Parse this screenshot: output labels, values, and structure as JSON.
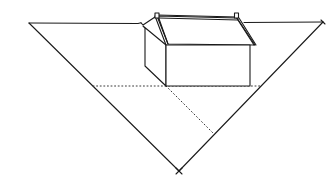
{
  "diagram": {
    "title": "",
    "colors": {
      "background": "#ffffff",
      "ink": "#1a1a1a",
      "construction": "#3a3a3a"
    },
    "elements": {
      "horizon_line": {
        "from": [
          29,
          23
        ],
        "to": [
          323,
          22
        ]
      },
      "left_ray": {
        "from": [
          29,
          23
        ],
        "to": [
          179,
          171
        ]
      },
      "right_ray": {
        "from": [
          323,
          22
        ],
        "to": [
          179,
          171
        ]
      },
      "bottom_vertex_mark": {
        "at": [
          179,
          171
        ],
        "glyph": "×"
      },
      "house_front_face": {
        "x1": 166,
        "y1": 45,
        "x2": 250,
        "y2": 86
      },
      "house_side_face": [
        [
          145,
          27
        ],
        [
          145,
          66
        ],
        [
          166,
          86
        ],
        [
          166,
          45
        ]
      ],
      "roof_ridge": {
        "from": [
          157,
          15
        ],
        "to": [
          237,
          17
        ]
      },
      "dotted_horizontal": {
        "from": [
          93,
          86
        ],
        "to": [
          262,
          86
        ]
      },
      "dotted_diagonal": {
        "from": [
          166,
          86
        ],
        "to": [
          213,
          133
        ]
      }
    }
  }
}
